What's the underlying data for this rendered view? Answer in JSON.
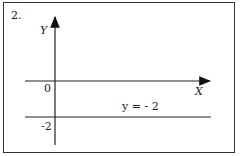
{
  "problem_number": "2.",
  "axes": {
    "y_label": "Y",
    "x_label": "X",
    "origin_label": "0",
    "tick_label": "-2"
  },
  "line": {
    "equation_label": "y = - 2",
    "y_value": -2
  }
}
